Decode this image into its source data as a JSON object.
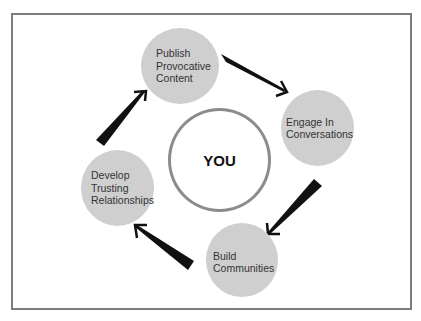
{
  "diagram": {
    "type": "cycle",
    "center": {
      "label": "YOU"
    },
    "nodes": [
      {
        "id": "publish",
        "lines": [
          "Publish",
          "Provocative",
          "Content"
        ]
      },
      {
        "id": "engage",
        "lines": [
          "Engage In",
          "Conversations"
        ]
      },
      {
        "id": "build",
        "lines": [
          "Build",
          "Communities"
        ]
      },
      {
        "id": "develop",
        "lines": [
          "Develop",
          "Trusting",
          "Relationships"
        ]
      }
    ],
    "edges": [
      {
        "from": "publish",
        "to": "engage"
      },
      {
        "from": "engage",
        "to": "build"
      },
      {
        "from": "build",
        "to": "develop"
      },
      {
        "from": "develop",
        "to": "publish"
      }
    ],
    "colors": {
      "node_fill": "#cfcfcf",
      "node_text": "#333333",
      "center_border": "#8c8c8c",
      "arrow": "#111111",
      "frame_border": "#7d7d7d"
    }
  }
}
